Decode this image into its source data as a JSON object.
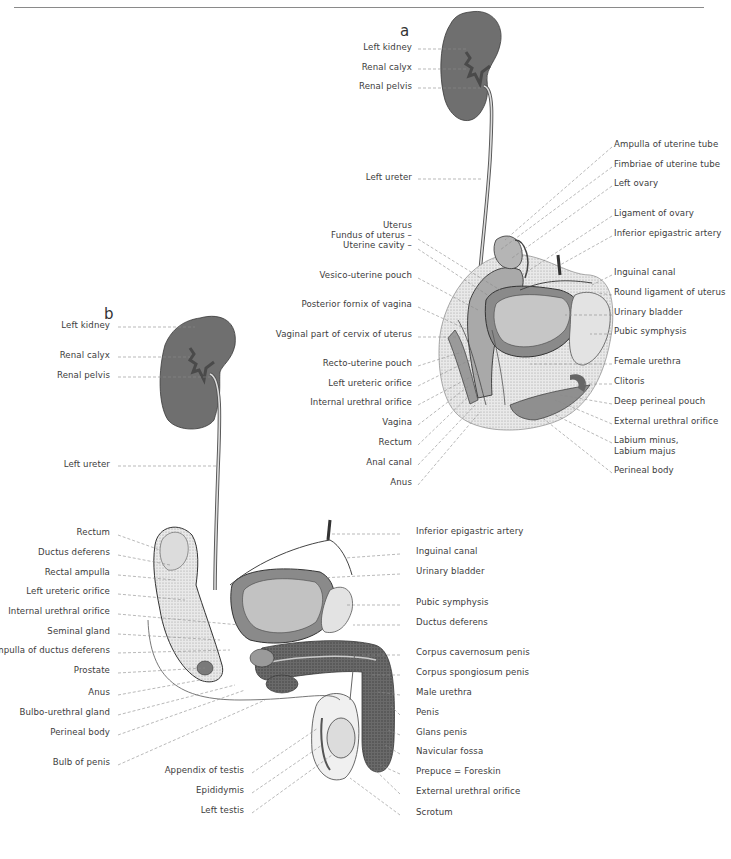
{
  "figure": {
    "panel_a": {
      "letter": "a",
      "left_labels": [
        {
          "text": "Left kidney",
          "y": 47
        },
        {
          "text": "Renal calyx",
          "y": 67
        },
        {
          "text": "Renal pelvis",
          "y": 86
        },
        {
          "text": "Left ureter",
          "y": 177
        },
        {
          "text": "Uterus",
          "y": 225
        },
        {
          "text": "Fundus of uterus –",
          "y": 235
        },
        {
          "text": "Uterine cavity –",
          "y": 245
        },
        {
          "text": "Vesico-uterine pouch",
          "y": 275
        },
        {
          "text": "Posterior fornix of vagina",
          "y": 304
        },
        {
          "text": "Vaginal part of cervix of uterus",
          "y": 334
        },
        {
          "text": "Recto-uterine pouch",
          "y": 363
        },
        {
          "text": "Left ureteric orifice",
          "y": 383
        },
        {
          "text": "Internal urethral orifice",
          "y": 402
        },
        {
          "text": "Vagina",
          "y": 422
        },
        {
          "text": "Rectum",
          "y": 442
        },
        {
          "text": "Anal canal",
          "y": 462
        },
        {
          "text": "Anus",
          "y": 482
        }
      ],
      "right_labels": [
        {
          "text": "Ampulla of uterine tube",
          "y": 144
        },
        {
          "text": "Fimbriae of uterine tube",
          "y": 164
        },
        {
          "text": "Left ovary",
          "y": 183
        },
        {
          "text": "Ligament of ovary",
          "y": 213
        },
        {
          "text": "Inferior epigastric artery",
          "y": 233
        },
        {
          "text": "Inguinal canal",
          "y": 272
        },
        {
          "text": "Round ligament of uterus",
          "y": 292
        },
        {
          "text": "Urinary bladder",
          "y": 312
        },
        {
          "text": "Pubic symphysis",
          "y": 331
        },
        {
          "text": "Female urethra",
          "y": 361
        },
        {
          "text": "Clitoris",
          "y": 381
        },
        {
          "text": "Deep perineal pouch",
          "y": 401
        },
        {
          "text": "External urethral orifice",
          "y": 421
        },
        {
          "text": "Labium minus,",
          "y": 440
        },
        {
          "text": "Labium majus",
          "y": 451
        },
        {
          "text": "Perineal body",
          "y": 470
        }
      ]
    },
    "panel_b": {
      "letter": "b",
      "left_labels": [
        {
          "text": "Left kidney",
          "y": 325
        },
        {
          "text": "Renal calyx",
          "y": 355
        },
        {
          "text": "Renal pelvis",
          "y": 375
        },
        {
          "text": "Left ureter",
          "y": 464
        },
        {
          "text": "Rectum",
          "y": 532
        },
        {
          "text": "Ductus deferens",
          "y": 552
        },
        {
          "text": "Rectal ampulla",
          "y": 572
        },
        {
          "text": "Left ureteric orifice",
          "y": 591
        },
        {
          "text": "Internal urethral orifice",
          "y": 611
        },
        {
          "text": "Seminal gland",
          "y": 631
        },
        {
          "text": "Ampulla of ductus deferens",
          "y": 650
        },
        {
          "text": "Prostate",
          "y": 670
        },
        {
          "text": "Anus",
          "y": 692
        },
        {
          "text": "Bulbo-urethral gland",
          "y": 712
        },
        {
          "text": "Perineal body",
          "y": 732
        },
        {
          "text": "Bulb of penis",
          "y": 762
        },
        {
          "text": "Appendix of testis",
          "y": 770
        },
        {
          "text": "Epididymis",
          "y": 790
        },
        {
          "text": "Left testis",
          "y": 810
        }
      ],
      "right_labels": [
        {
          "text": "Inferior epigastric artery",
          "y": 531
        },
        {
          "text": "Inguinal canal",
          "y": 551
        },
        {
          "text": "Urinary bladder",
          "y": 571
        },
        {
          "text": "Pubic symphysis",
          "y": 602
        },
        {
          "text": "Ductus deferens",
          "y": 622
        },
        {
          "text": "Corpus cavernosum penis",
          "y": 652
        },
        {
          "text": "Corpus spongiosum penis",
          "y": 672
        },
        {
          "text": "Male urethra",
          "y": 692
        },
        {
          "text": "Penis",
          "y": 712
        },
        {
          "text": "Glans penis",
          "y": 732
        },
        {
          "text": "Navicular fossa",
          "y": 751
        },
        {
          "text": "Prepuce = Foreskin",
          "y": 771
        },
        {
          "text": "External urethral orifice",
          "y": 791
        },
        {
          "text": "Scrotum",
          "y": 812
        }
      ]
    }
  }
}
